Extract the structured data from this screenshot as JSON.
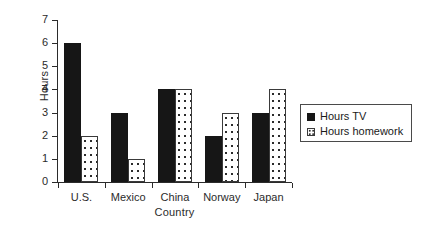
{
  "chart_data": {
    "type": "bar",
    "title": "",
    "xlabel": "Country",
    "ylabel": "Hours",
    "categories": [
      "U.S.",
      "Mexico",
      "China",
      "Norway",
      "Japan"
    ],
    "series": [
      {
        "name": "Hours TV",
        "values": [
          6,
          3,
          4,
          2,
          3
        ],
        "color": "#161616",
        "fill": "solid"
      },
      {
        "name": "Hours homework",
        "values": [
          2,
          1,
          4,
          3,
          4
        ],
        "color": "#ffffff",
        "fill": "dotted"
      }
    ],
    "ylim": [
      0,
      7
    ],
    "yticks": [
      "0",
      "1",
      "2",
      "3",
      "4",
      "5",
      "6",
      "7"
    ],
    "grid": false,
    "legend_position": "right"
  },
  "legend": {
    "entries": [
      {
        "label": "Hours TV",
        "swatch": "solid-black-square-icon"
      },
      {
        "label": "Hours homework",
        "swatch": "dotted-white-square-icon"
      }
    ]
  }
}
